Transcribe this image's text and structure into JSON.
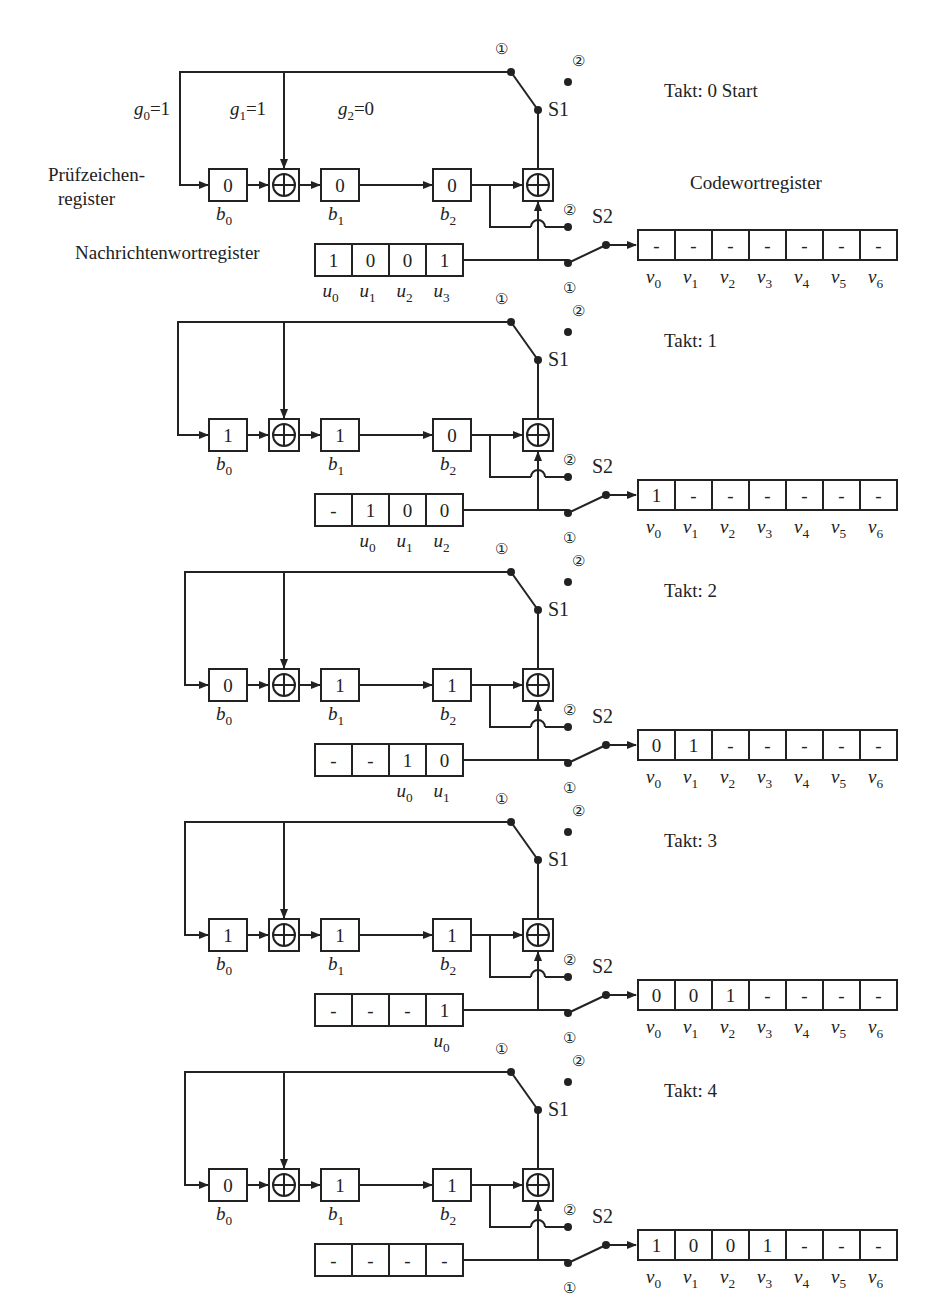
{
  "labels": {
    "pruef_line1": "Prüfzeichen-",
    "pruef_line2": "register",
    "nachricht": "Nachrichtenwortregister",
    "codewort": "Codewortregister",
    "switch1": "S1",
    "switch2": "S2",
    "pos1": "①",
    "pos2": "②",
    "takt_prefix": "Takt: "
  },
  "coefficients": [
    {
      "name": "g",
      "sub": "0",
      "value": "1"
    },
    {
      "name": "g",
      "sub": "1",
      "value": "1"
    },
    {
      "name": "g",
      "sub": "2",
      "value": "0"
    }
  ],
  "check_register_labels": [
    {
      "name": "b",
      "sub": "0"
    },
    {
      "name": "b",
      "sub": "1"
    },
    {
      "name": "b",
      "sub": "2"
    }
  ],
  "codeword_labels": [
    {
      "name": "v",
      "sub": "0"
    },
    {
      "name": "v",
      "sub": "1"
    },
    {
      "name": "v",
      "sub": "2"
    },
    {
      "name": "v",
      "sub": "3"
    },
    {
      "name": "v",
      "sub": "4"
    },
    {
      "name": "v",
      "sub": "5"
    },
    {
      "name": "v",
      "sub": "6"
    }
  ],
  "steps": [
    {
      "takt": "0",
      "suffix": "Start",
      "y": 60,
      "x_off": 0,
      "b": [
        "0",
        "0",
        "0"
      ],
      "u": [
        "1",
        "0",
        "0",
        "1"
      ],
      "u_labels": [
        "u0",
        "u1",
        "u2",
        "u3"
      ],
      "v": [
        "-",
        "-",
        "-",
        "-",
        "-",
        "-",
        "-"
      ]
    },
    {
      "takt": "1",
      "suffix": "",
      "y": 310,
      "x_off": 0,
      "b": [
        "1",
        "1",
        "0"
      ],
      "u": [
        "-",
        "1",
        "0",
        "0"
      ],
      "u_labels": [
        "",
        "u0",
        "u1",
        "u2"
      ],
      "v": [
        "1",
        "-",
        "-",
        "-",
        "-",
        "-",
        "-"
      ]
    },
    {
      "takt": "2",
      "suffix": "",
      "y": 560,
      "x_off": 0,
      "b": [
        "0",
        "1",
        "1"
      ],
      "u": [
        "-",
        "-",
        "1",
        "0"
      ],
      "u_labels": [
        "",
        "",
        "u0",
        "u1"
      ],
      "v": [
        "0",
        "1",
        "-",
        "-",
        "-",
        "-",
        "-"
      ]
    },
    {
      "takt": "3",
      "suffix": "",
      "y": 810,
      "x_off": 0,
      "b": [
        "1",
        "1",
        "1"
      ],
      "u": [
        "-",
        "-",
        "-",
        "1"
      ],
      "u_labels": [
        "",
        "",
        "",
        "u0"
      ],
      "v": [
        "0",
        "0",
        "1",
        "-",
        "-",
        "-",
        "-"
      ]
    },
    {
      "takt": "4",
      "suffix": "",
      "y": 1060,
      "x_off": 0,
      "b": [
        "0",
        "1",
        "1"
      ],
      "u": [
        "-",
        "-",
        "-",
        "-"
      ],
      "u_labels": [
        "",
        "",
        "",
        ""
      ],
      "v": [
        "1",
        "0",
        "0",
        "1",
        "-",
        "-",
        "-"
      ]
    }
  ],
  "colors": {
    "ink": "#222222",
    "background": "#ffffff"
  }
}
